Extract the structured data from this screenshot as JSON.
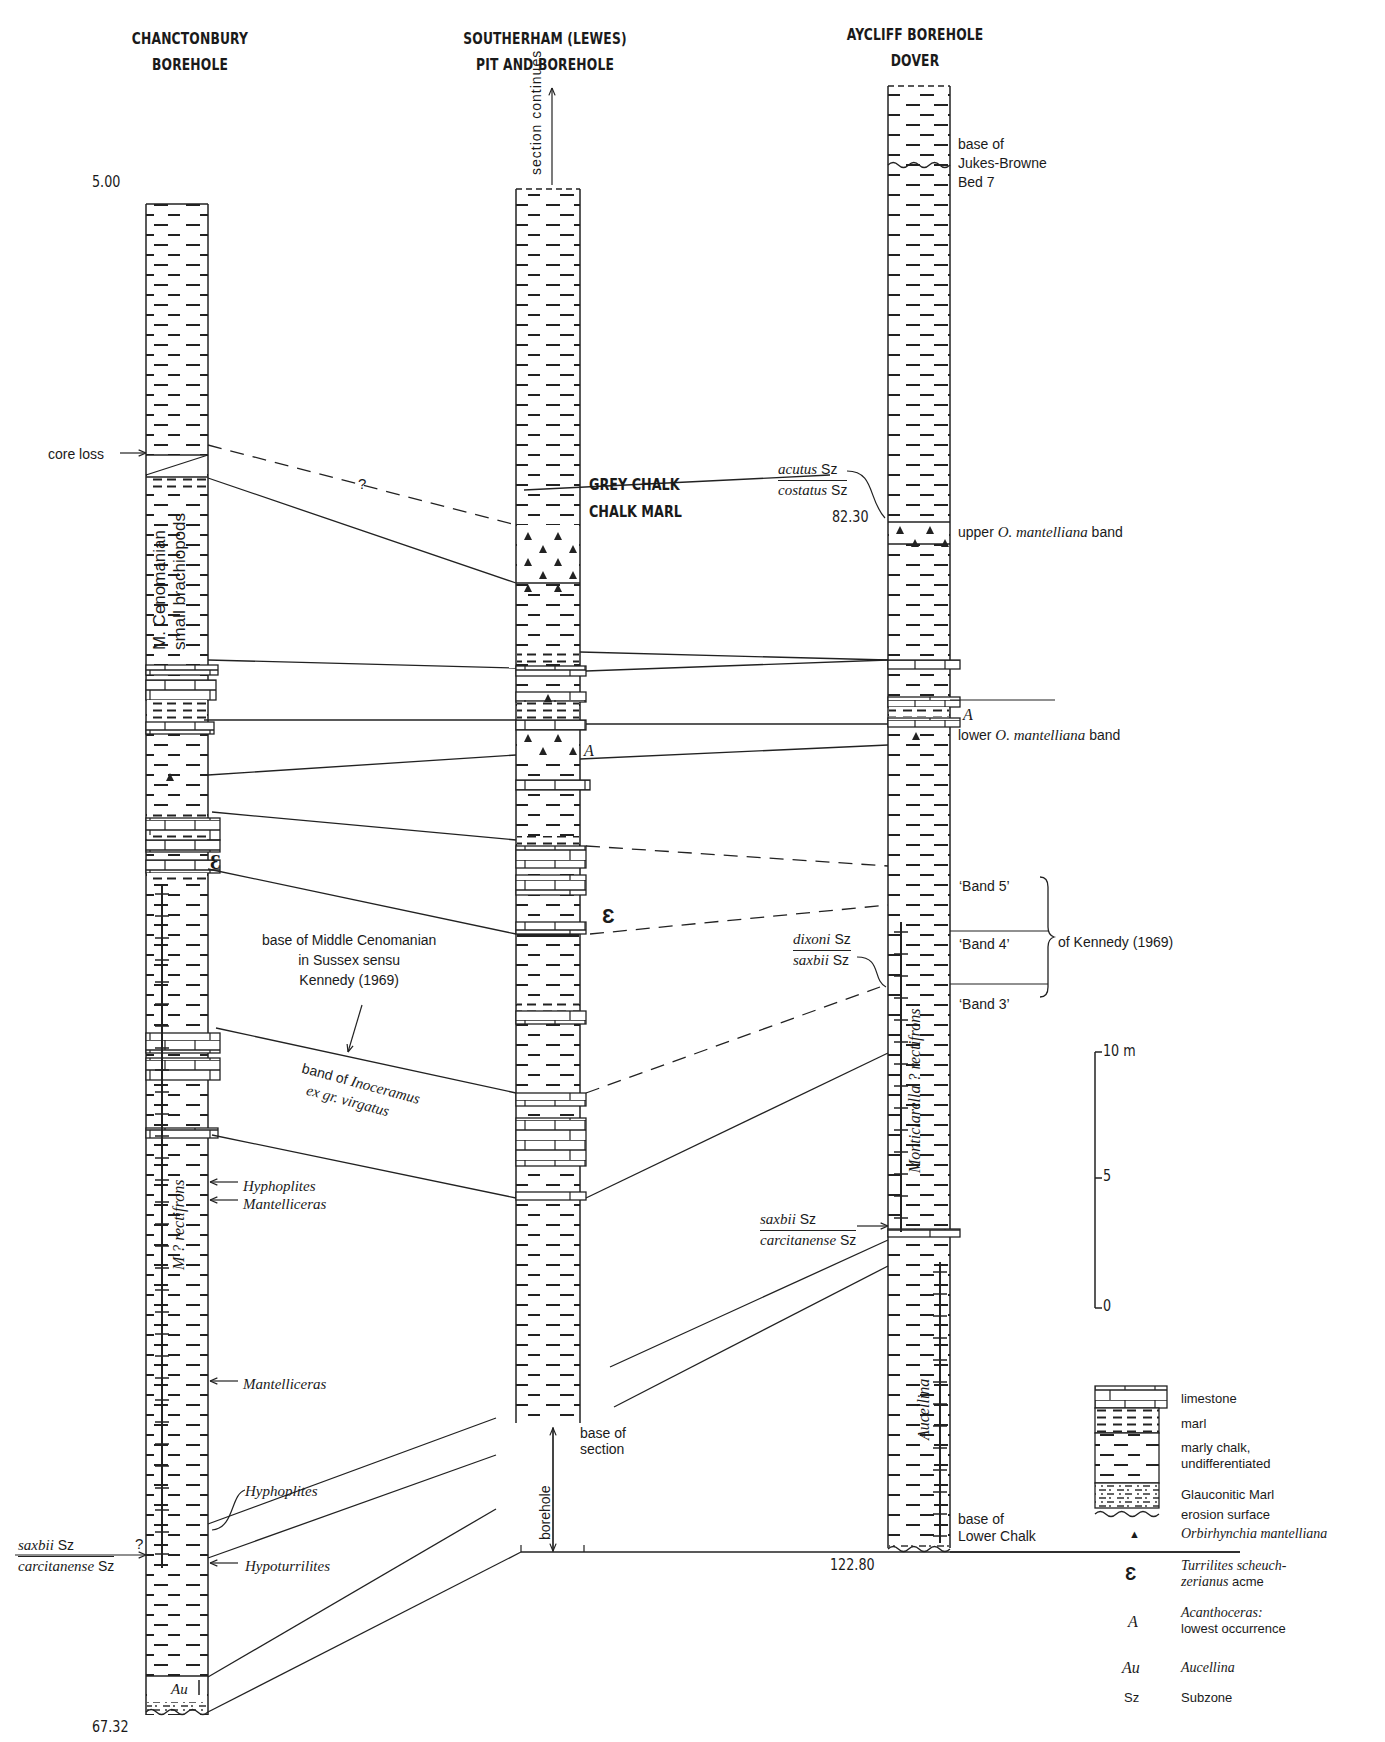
{
  "columns": [
    {
      "id": "chanctonbury",
      "title_line1": "CHANCTONBURY",
      "title_line2": "BOREHOLE",
      "top_depth": "5.00",
      "base_depth": "67.32"
    },
    {
      "id": "southerham",
      "title_line1": "SOUTHERHAM (LEWES)",
      "title_line2": "PIT AND BOREHOLE",
      "top_note": "section continues",
      "base_note": "base of section",
      "borehole_note": "borehole"
    },
    {
      "id": "aycliff",
      "title_line1": "AYCLIFF BOREHOLE",
      "title_line2": "DOVER",
      "depth_marker": "82.30",
      "base_depth": "122.80"
    }
  ],
  "formations": {
    "upper": "GREY CHALK",
    "lower": "CHALK MARL"
  },
  "annotations": {
    "core_loss": "core loss",
    "query_mark": "?",
    "m_cenomanian_line1": "M. Cenomanian",
    "m_cenomanian_line2": "small brachiopods",
    "middle_cenomanian_line1": "base of Middle Cenomanian",
    "middle_cenomanian_line2": "in Sussex sensu",
    "middle_cenomanian_line3": "Kennedy (1969)",
    "inoceramus_line1_pre": "band of ",
    "inoceramus_line1_it": "Inoceramus",
    "inoceramus_line2": "ex  gr. virgatus",
    "m_rectifrons": "M ? rectifrons",
    "monticlarella": "Monticlarella ?  rectifrons",
    "aucellina": "Aucellina",
    "au": "Au",
    "acanthoceras_marker": "A",
    "turrilites_marker": "Ɛ",
    "hyphoplites": "Hyphoplites",
    "mantelliceras": "Mantelliceras",
    "mantelliceras_2": "Mantelliceras",
    "hyphoplites_2": "Hyphoplites",
    "hypoturrilites": "Hypoturrilites",
    "jukes_browne_line1": "base of",
    "jukes_browne_line2": "Jukes-Browne",
    "jukes_browne_line3": "Bed 7",
    "upper_band_pre": "upper ",
    "upper_band_it": "O. mantelliana",
    "upper_band_post": " band",
    "lower_band_pre": "lower ",
    "lower_band_it": "O. mantelliana",
    "lower_band_post": " band",
    "band5": "‘Band 5’",
    "band4": "‘Band 4’",
    "band3": "‘Band 3’",
    "of_kennedy": "of Kennedy (1969)",
    "base_lower_chalk_line1": "base of",
    "base_lower_chalk_line2": "Lower Chalk"
  },
  "subzones": [
    {
      "id": "acutus_costatus",
      "top_it": "acutus",
      "top_sz": " Sz",
      "bottom_it": "costatus",
      "bottom_sz": " Sz"
    },
    {
      "id": "dixoni_saxbii",
      "top_it": "dixoni",
      "top_sz": " Sz",
      "bottom_it": "saxbii",
      "bottom_sz": " Sz"
    },
    {
      "id": "saxbii_carcitanense_aycliff",
      "top_it": "saxbii",
      "top_sz": " Sz",
      "bottom_it": "carcitanense",
      "bottom_sz": " Sz"
    },
    {
      "id": "saxbii_carcitanense_chanct",
      "top_it": "saxbii",
      "top_sz": " Sz",
      "bottom_it": "carcitanense",
      "bottom_sz": " Sz"
    }
  ],
  "scale_bar": {
    "top": "10 m",
    "mid": "5",
    "bottom": "0"
  },
  "legend": [
    {
      "symbol": "limestone-pattern",
      "label": "limestone"
    },
    {
      "symbol": "marl-pattern",
      "label": "marl"
    },
    {
      "symbol": "marly-chalk-pattern",
      "label_line1": "marly chalk,",
      "label_line2": "undifferentiated"
    },
    {
      "symbol": "glauconitic-marl-pattern",
      "label": "Glauconitic Marl"
    },
    {
      "symbol": "erosion-surface",
      "label": "erosion surface"
    },
    {
      "symbol": "▲",
      "label_it": "Orbirhynchia mantelliana"
    },
    {
      "symbol": "Ɛ",
      "label_it_line1": "Turrilites scheuch-",
      "label_it_line2": "zerianus",
      "label_line2_post": " acme"
    },
    {
      "symbol": "A",
      "label_it_line1": "Acanthoceras:",
      "label_line2": "lowest occurrence"
    },
    {
      "symbol": "Au",
      "label_it": "Aucellina"
    },
    {
      "symbol": "Sz",
      "label": "Subzone"
    }
  ]
}
